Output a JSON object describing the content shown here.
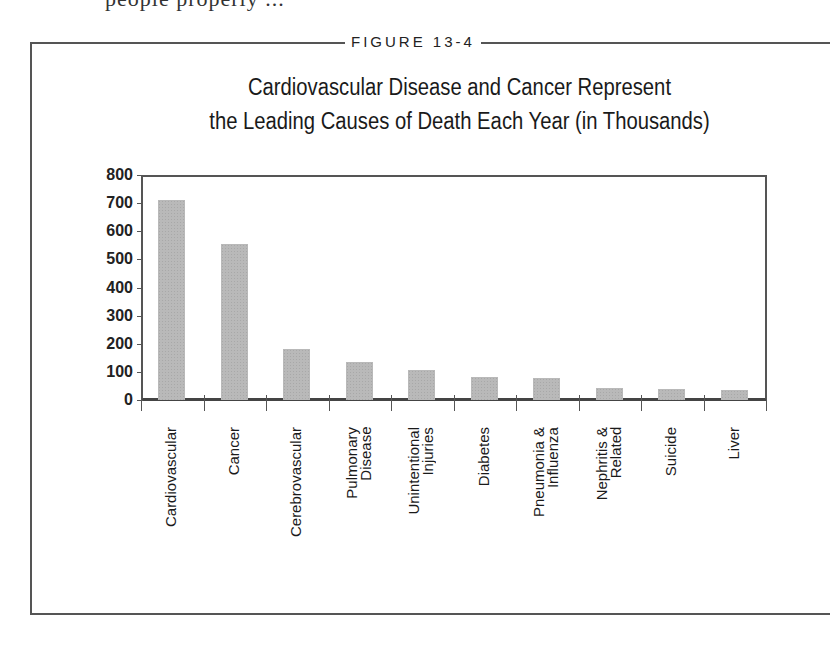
{
  "page": {
    "cutoff_text": "people properly ...",
    "figure_label": "FIGURE 13-4"
  },
  "chart_data": {
    "type": "bar",
    "title": "Cardiovascular Disease and Cancer Represent the Leading Causes of Death Each Year (in Thousands)",
    "title_lines": [
      "Cardiovascular Disease and Cancer Represent",
      "the Leading Causes of Death Each Year (in Thousands)"
    ],
    "xlabel": "",
    "ylabel": "",
    "ylim": [
      0,
      800
    ],
    "yticks": [
      "0",
      "100",
      "200",
      "300",
      "400",
      "500",
      "600",
      "700",
      "800"
    ],
    "grid": false,
    "legend": null,
    "categories": [
      "Cardiovascular",
      "Cancer",
      "Cerebrovascular",
      "Pulmonary Disease",
      "Unintentional Injuries",
      "Diabetes",
      "Pneumonia & Influenza",
      "Nephritis & Related",
      "Suicide",
      "Liver"
    ],
    "category_label_lines": [
      "Cardiovascular",
      "Cancer",
      "Cerebrovascular",
      "Pulmonary\nDisease",
      "Unintentional\nInjuries",
      "Diabetes",
      "Pneumonia &\nInfluenza",
      "Nephritis &\nRelated",
      "Suicide",
      "Liver"
    ],
    "values": [
      710,
      555,
      182,
      135,
      106,
      82,
      78,
      42,
      38,
      35
    ],
    "bar_color": "#b9b9b9"
  }
}
